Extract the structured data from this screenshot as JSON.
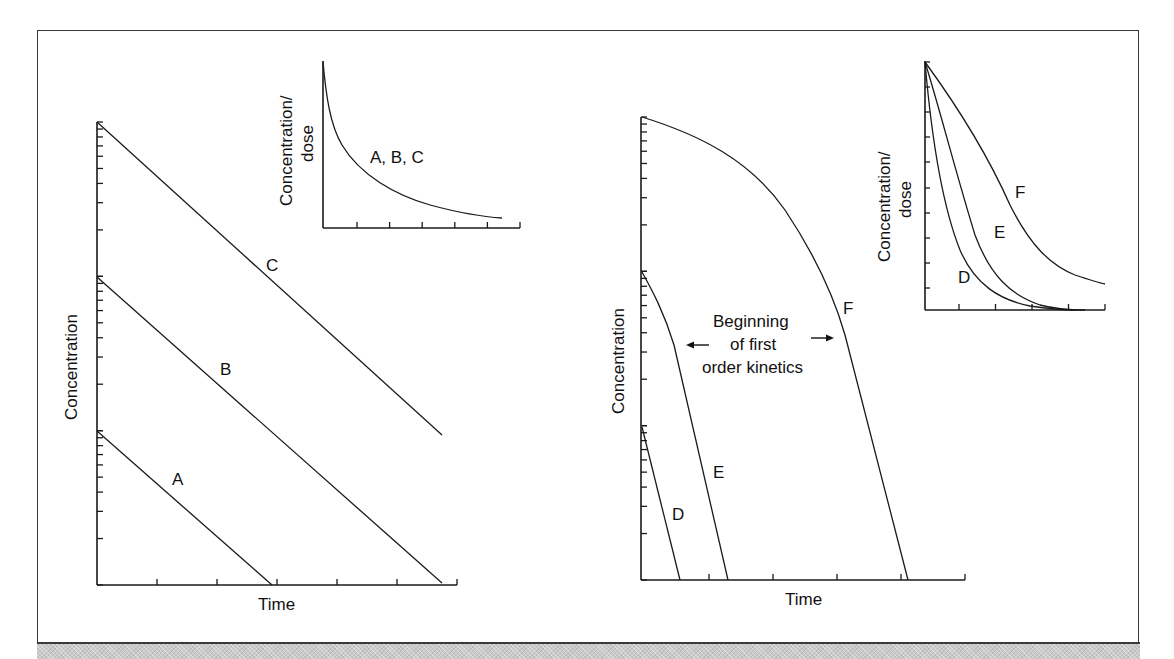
{
  "chart_data": [
    {
      "id": "left-main",
      "type": "line",
      "title": "",
      "xlabel": "Time",
      "ylabel": "Concentration",
      "y_scale": "log",
      "ylim": [
        1,
        1000
      ],
      "x_ticks": 6,
      "grid": false,
      "legend": "inline labels",
      "series": [
        {
          "name": "A",
          "x": [
            0,
            3
          ],
          "y": [
            10,
            1
          ],
          "label_pos": [
            2.0,
            6
          ]
        },
        {
          "name": "B",
          "x": [
            0,
            6
          ],
          "y": [
            100,
            1
          ],
          "label_pos": [
            2.5,
            45
          ]
        },
        {
          "name": "C",
          "x": [
            0,
            6
          ],
          "y": [
            1000,
            10
          ],
          "label_pos": [
            3.0,
            300
          ]
        }
      ]
    },
    {
      "id": "left-inset",
      "type": "line",
      "title": "",
      "xlabel": "",
      "ylabel": "Concentration/ dose",
      "y_scale": "linear",
      "x_ticks": 6,
      "grid": false,
      "series": [
        {
          "name": "A, B, C",
          "x": [
            0,
            0.3,
            0.6,
            1,
            1.5,
            2,
            3,
            4,
            5,
            5.5
          ],
          "y": [
            1.0,
            0.62,
            0.45,
            0.34,
            0.25,
            0.19,
            0.11,
            0.06,
            0.04,
            0.035
          ]
        }
      ]
    },
    {
      "id": "right-main",
      "type": "line",
      "title": "",
      "xlabel": "Time",
      "ylabel": "Concentration",
      "y_scale": "log",
      "ylim": [
        1,
        1000
      ],
      "x_ticks": 5,
      "grid": false,
      "annotation": "Beginning of first order kinetics",
      "series": [
        {
          "name": "D",
          "x": [
            0,
            0.6
          ],
          "y": [
            10,
            1
          ]
        },
        {
          "name": "E",
          "x": [
            0,
            0.5,
            1.35
          ],
          "y": [
            100,
            33,
            1
          ]
        },
        {
          "name": "F",
          "x": [
            0,
            1.4,
            2.0,
            2.5,
            2.8,
            3.0,
            3.15,
            4.2
          ],
          "y": [
            1000,
            570,
            310,
            160,
            88,
            56,
            36,
            1
          ]
        }
      ]
    },
    {
      "id": "right-inset",
      "type": "line",
      "title": "",
      "xlabel": "",
      "ylabel": "Concentration/ dose",
      "y_scale": "linear",
      "x_ticks": 5,
      "grid": false,
      "series": [
        {
          "name": "D",
          "x": [
            0,
            0.5,
            1,
            1.5,
            2,
            3,
            4
          ],
          "y": [
            1.0,
            0.62,
            0.36,
            0.19,
            0.1,
            0.03,
            0.0
          ]
        },
        {
          "name": "E",
          "x": [
            0,
            0.5,
            1,
            1.5,
            2,
            3,
            4
          ],
          "y": [
            1.0,
            0.75,
            0.52,
            0.3,
            0.14,
            0.04,
            0.0
          ]
        },
        {
          "name": "F",
          "x": [
            0,
            1,
            2,
            2.5,
            3,
            4,
            4.9
          ],
          "y": [
            1.0,
            0.76,
            0.52,
            0.4,
            0.3,
            0.17,
            0.1
          ]
        }
      ]
    }
  ],
  "labels": {
    "left_xlabel": "Time",
    "left_ylabel": "Concentration",
    "left_inset_ylabel_line1": "Concentration/",
    "left_inset_ylabel_line2": "dose",
    "left_inset_curve_label": "A, B, C",
    "curve_a": "A",
    "curve_b": "B",
    "curve_c": "C",
    "right_xlabel": "Time",
    "right_ylabel": "Concentration",
    "right_inset_ylabel_line1": "Concentration/",
    "right_inset_ylabel_line2": "dose",
    "curve_d": "D",
    "curve_e": "E",
    "curve_f": "F",
    "inset_d": "D",
    "inset_e": "E",
    "inset_f": "F",
    "annotation_line1": "Beginning",
    "annotation_line2": "of first",
    "annotation_line3": "order kinetics"
  },
  "colors": {
    "line": "#1a1a1a",
    "frame": "#3a3a3a",
    "footer": "#c9c9c9"
  }
}
